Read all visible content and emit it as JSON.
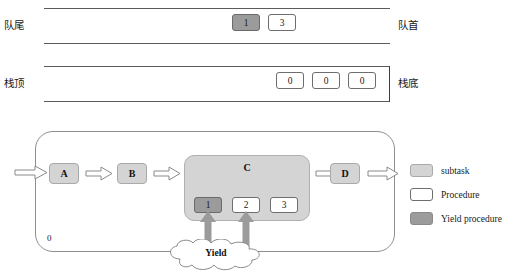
{
  "queue": {
    "left_label": "队尾",
    "right_label": "队首",
    "cells": [
      {
        "value": "1",
        "kind": "yield"
      },
      {
        "value": "3",
        "kind": "white"
      }
    ]
  },
  "stack": {
    "left_label": "栈顶",
    "right_label": "栈底",
    "cells": [
      {
        "value": "0",
        "kind": "white"
      },
      {
        "value": "0",
        "kind": "white"
      },
      {
        "value": "0",
        "kind": "white"
      }
    ]
  },
  "diagram": {
    "container_label": "0",
    "tasks": [
      {
        "label": "A"
      },
      {
        "label": "B"
      },
      {
        "label": "D"
      }
    ],
    "subtask": {
      "label": "C",
      "cells": [
        {
          "value": "1",
          "kind": "yield"
        },
        {
          "value": "2",
          "kind": "white"
        },
        {
          "value": "3",
          "kind": "white"
        }
      ]
    },
    "cloud_label": "Yield"
  },
  "legend": {
    "items": [
      {
        "label": "subtask",
        "kind": "sub"
      },
      {
        "label": "Procedure",
        "kind": "proc"
      },
      {
        "label": "Yield procedure",
        "kind": "yield"
      }
    ]
  },
  "colors": {
    "subtask_fill": "#d4d4d4",
    "procedure_fill": "#ffffff",
    "yield_fill": "#9b9b9b",
    "line": "#5b5b5b"
  }
}
